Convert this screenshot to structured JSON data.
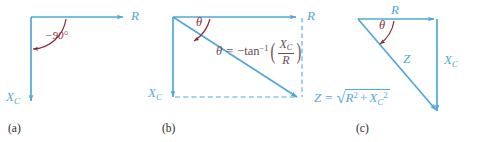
{
  "figure": {
    "line_color": "#4FA9D8",
    "angle_color": "#8C2C38",
    "equation_color": "#6B4A52",
    "panel_label_color": "#2B2B2B",
    "background": "#ffffff"
  },
  "panels": [
    {
      "id": "a",
      "label": "(a)",
      "axis_r": "R",
      "axis_xc_symbol": "X",
      "axis_xc_subscript": "C",
      "angle_label": "−90°",
      "description": "perpendicular R and X_C axes with -90 degree arc"
    },
    {
      "id": "b",
      "label": "(b)",
      "axis_r": "R",
      "axis_xc_symbol": "X",
      "axis_xc_subscript": "C",
      "angle_label": "θ",
      "theta_equation": {
        "lhs": "θ",
        "equals": "=",
        "minus": "−",
        "function": "tan",
        "exponent": "−1",
        "numerator_symbol": "X",
        "numerator_subscript": "C",
        "denominator": "R",
        "paren_open": "(",
        "paren_close": ")"
      },
      "z_equation": {
        "lhs": "Z",
        "equals": "=",
        "radical": "√",
        "term1": "R",
        "term1_exp": "2",
        "plus": "+",
        "term2": "X",
        "term2_sub": "C",
        "term2_exp": "2"
      }
    },
    {
      "id": "c",
      "label": "(c)",
      "axis_r": "R",
      "axis_xc_symbol": "X",
      "axis_xc_subscript": "C",
      "hypotenuse": "Z",
      "angle_label": "θ",
      "description": "impedance triangle with R, X_C legs and Z hypotenuse"
    }
  ]
}
